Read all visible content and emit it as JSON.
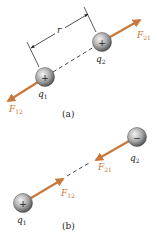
{
  "colors": {
    "force_arrow": "#c8783a",
    "charge_sphere_light": "#eeeeee",
    "charge_sphere_dark": "#5a5a5a",
    "line": "#333333"
  },
  "panel_a": {
    "caption": "(a)",
    "distance_label": "r",
    "q1": {
      "label": "q",
      "sub": "1",
      "sign": "+"
    },
    "q2": {
      "label": "q",
      "sub": "2",
      "sign": "+"
    },
    "force_12": {
      "label": "F",
      "sub": "12"
    },
    "force_21": {
      "label": "F",
      "sub": "21"
    }
  },
  "panel_b": {
    "caption": "(b)",
    "q1": {
      "label": "q",
      "sub": "1",
      "sign": "+"
    },
    "q2": {
      "label": "q",
      "sub": "2",
      "sign": "−"
    },
    "force_12": {
      "label": "F",
      "sub": "12"
    },
    "force_21": {
      "label": "F",
      "sub": "21"
    }
  }
}
